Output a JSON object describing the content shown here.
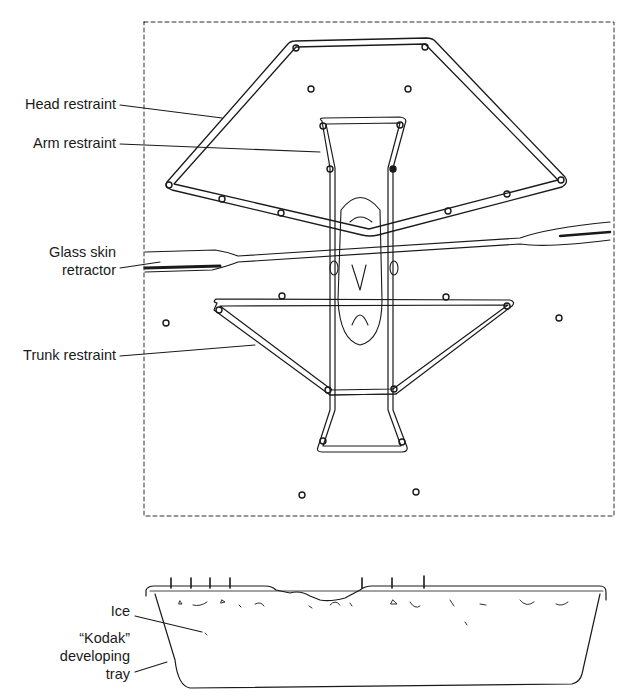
{
  "figure": {
    "top_view": {
      "labels": {
        "head_restraint": "Head restraint",
        "arm_restraint": "Arm restraint",
        "glass_skin_retractor_line1": "Glass skin",
        "glass_skin_retractor_line2": "retractor",
        "trunk_restraint": "Trunk restraint"
      }
    },
    "side_view": {
      "labels": {
        "ice": "Ice",
        "tray_line1": "“Kodak”",
        "tray_line2": "developing",
        "tray_line3": "tray"
      }
    },
    "colors": {
      "ink": "#1a1a1a",
      "background": "#ffffff"
    }
  }
}
